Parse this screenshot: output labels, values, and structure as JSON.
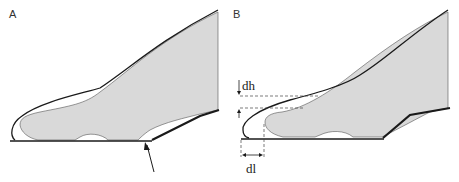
{
  "panels": [
    {
      "label": "A",
      "annotation": "arrow pointing to sole bend"
    },
    {
      "label": "B",
      "annotations": {
        "dh": "dh",
        "dl": "dl"
      }
    }
  ],
  "colors": {
    "foot_fill": "#d9d9d9",
    "outline": "#1a1a1a",
    "dash": "#444444"
  }
}
